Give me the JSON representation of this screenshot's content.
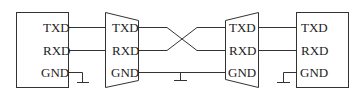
{
  "diagram": {
    "left_device": {
      "pins": [
        "TXD",
        "RXD",
        "GND"
      ]
    },
    "left_converter": {
      "pins": [
        "TXD",
        "RXD",
        "GND"
      ]
    },
    "right_converter": {
      "pins": [
        "TXD",
        "RXD",
        "GND"
      ]
    },
    "right_device": {
      "pins": [
        "TXD",
        "RXD",
        "GND"
      ]
    },
    "connections": [
      {
        "from": "left_device.TXD",
        "to": "left_converter.TXD"
      },
      {
        "from": "left_device.RXD",
        "to": "left_converter.RXD"
      },
      {
        "from": "left_converter.TXD",
        "to": "right_converter.RXD",
        "crossed": true
      },
      {
        "from": "left_converter.RXD",
        "to": "right_converter.TXD",
        "crossed": true
      },
      {
        "from": "left_converter.GND",
        "to": "right_converter.GND"
      },
      {
        "from": "right_converter.TXD",
        "to": "right_device.TXD"
      },
      {
        "from": "right_converter.RXD",
        "to": "right_device.RXD"
      }
    ],
    "grounds": [
      "left_device.GND",
      "cable.GND",
      "right_device.GND"
    ]
  }
}
